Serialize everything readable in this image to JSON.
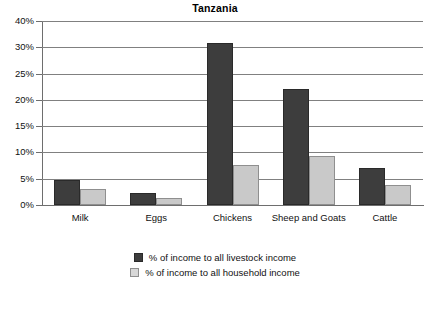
{
  "chart_data": {
    "type": "bar",
    "title": "Tanzania",
    "xlabel": "",
    "ylabel": "",
    "categories": [
      "Milk",
      "Eggs",
      "Chickens",
      "Sheep and Goats",
      "Cattle"
    ],
    "series": [
      {
        "name": "% of income to all livestock income",
        "color": "#3d3d3d",
        "values": [
          4.8,
          2.3,
          31.6,
          22.0,
          7.0
        ]
      },
      {
        "name": "% of income to all household income",
        "color": "#c9c9c9",
        "values": [
          3.0,
          1.4,
          7.7,
          9.4,
          3.8
        ]
      }
    ],
    "ylim": [
      0,
      40
    ],
    "ytick_values": [
      0,
      5,
      10,
      15,
      20,
      25,
      30,
      40
    ],
    "ytick_labels": [
      "0%",
      "5%",
      "10%",
      "15%",
      "20%",
      "25%",
      "30%",
      "40%"
    ],
    "grid": true,
    "legend_position": "bottom"
  },
  "legend": {
    "entries": [
      {
        "label": "% of income to all livestock income"
      },
      {
        "label": "% of income to all household income"
      }
    ]
  }
}
